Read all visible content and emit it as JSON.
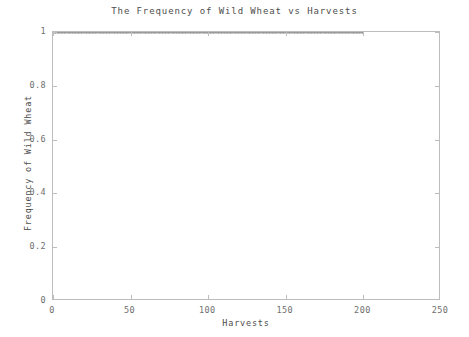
{
  "chart_data": {
    "type": "scatter",
    "title": "The Frequency of Wild Wheat vs Harvests",
    "xlabel": "Harvests",
    "ylabel": "Frequency of Wild Wheat",
    "xlim": [
      0,
      250
    ],
    "ylim": [
      0,
      1
    ],
    "grid": false,
    "legend": null,
    "marker": {
      "style": "dot",
      "color": "#9a9a9a",
      "size": 2
    },
    "x_ticks": [
      0,
      50,
      100,
      150,
      200,
      250
    ],
    "x_tick_labels": [
      "0",
      "50",
      "100",
      "150",
      "200",
      "250"
    ],
    "y_ticks": [
      0,
      0.2,
      0.4,
      0.6,
      0.8,
      1
    ],
    "y_tick_labels": [
      "0",
      "0.2",
      "0.4",
      "0.6",
      "0.8",
      "1"
    ],
    "series": [
      {
        "name": "Frequency of Wild Wheat",
        "x_start": 0,
        "x_end": 200,
        "x_step": 1,
        "constant_value": 1.0,
        "n_points": 201,
        "description": "Frequency remains flat at 1.0 across all harvests from 0 to 200."
      }
    ]
  },
  "colors": {
    "axis": "#bdbdbd",
    "tick_label": "#6e6e6e",
    "axis_title": "#4d4d4d",
    "marker": "#9a9a9a",
    "background": "#ffffff"
  }
}
